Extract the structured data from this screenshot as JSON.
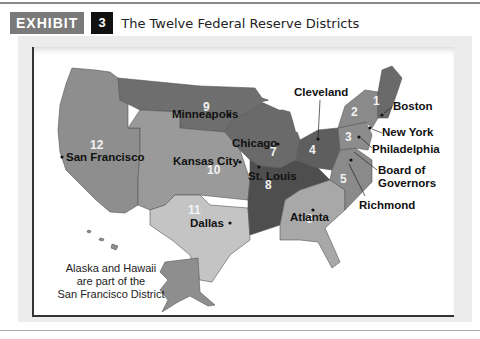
{
  "header": {
    "exhibit_label": "EXHIBIT",
    "exhibit_number": "3",
    "title": "The Twelve Federal Reserve Districts"
  },
  "map": {
    "districts": [
      {
        "number": "1",
        "city": "Boston"
      },
      {
        "number": "2",
        "city": "New York"
      },
      {
        "number": "3",
        "city": "Philadelphia"
      },
      {
        "number": "4",
        "city": "Cleveland"
      },
      {
        "number": "5",
        "city": "Richmond"
      },
      {
        "number": "6",
        "city": "Atlanta"
      },
      {
        "number": "7",
        "city": "Chicago"
      },
      {
        "number": "8",
        "city": "St. Louis"
      },
      {
        "number": "9",
        "city": "Minneapolis"
      },
      {
        "number": "10",
        "city": "Kansas City"
      },
      {
        "number": "11",
        "city": "Dallas"
      },
      {
        "number": "12",
        "city": "San Francisco"
      }
    ],
    "board_label": "Board of Governors",
    "board_line1": "Board of",
    "board_line2": "Governors",
    "note_line1": "Alaska and Hawaii",
    "note_line2": "are part of the",
    "note_line3": "San Francisco District",
    "colors": {
      "d12": "#8e8e8e",
      "d9": "#6e6e6e",
      "d10": "#9a9a9a",
      "d11": "#c4c4c4",
      "d7": "#6a6a6a",
      "d8": "#4e4e4e",
      "d4": "#5e5e5e",
      "d6": "#a8a8a8",
      "d5": "#8a8a8a",
      "d3": "#8c8c8c",
      "d2": "#8a8a8a",
      "d1": "#6a6a6a"
    }
  }
}
